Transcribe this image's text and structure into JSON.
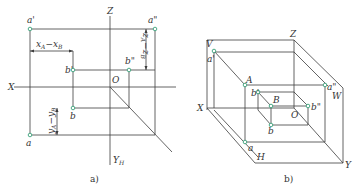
{
  "header": {
    "cropped_text": "········ ··· ·· ········· ·····"
  },
  "diagram_a": {
    "caption": "a)",
    "axes": {
      "x": "X",
      "z": "Z",
      "yh": "Y",
      "yh_sub": "H",
      "origin": "O"
    },
    "points": {
      "a_prime": "a'",
      "a_double_prime": "a\"",
      "b_prime": "b'",
      "b_double_prime": "b\"",
      "a": "a",
      "b": "b"
    },
    "dimensions": {
      "x_diff": "x",
      "x_diff_a": "A",
      "x_diff_minus": "−x",
      "x_diff_b": "B",
      "z_diff": "z",
      "z_diff_a": "A",
      "z_diff_minus": "−z",
      "z_diff_b": "B",
      "y_diff": "y",
      "y_diff_a": "A",
      "y_diff_minus": "−y",
      "y_diff_b": "B"
    }
  },
  "diagram_b": {
    "caption": "b)",
    "planes": {
      "v": "V",
      "w": "W",
      "h": "H"
    },
    "axes": {
      "x": "X",
      "y": "Y",
      "z": "Z",
      "origin": "O"
    },
    "points": {
      "a_prime": "a'",
      "A": "A",
      "a_double_prime": "a\"",
      "b_prime": "b'",
      "B": "B",
      "b_double_prime": "b\"",
      "a": "a",
      "b": "b"
    }
  },
  "colors": {
    "line": "#3c3c3c",
    "point_stroke": "#3aa37a",
    "text": "#333333"
  }
}
